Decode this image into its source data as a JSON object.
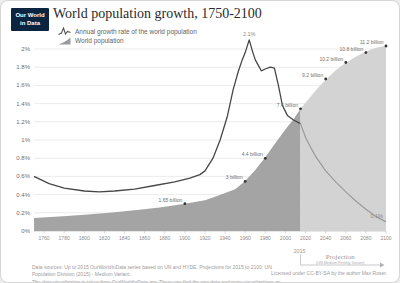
{
  "logo": {
    "line1": "Our World",
    "line2": "in Data"
  },
  "header": {
    "title": "World population growth, 1750-2100"
  },
  "legend": {
    "growth_label": "Annual growth rate of the world population",
    "population_label": "World population"
  },
  "footer": {
    "sources_line1": "Data sources: Up to 2015 OurWorldInData series based on UN and HYDE. Projections for 2015 to 2100: UN Population Division (2015) - Medium Variant.",
    "sources_line2": "The data visualization is taken from OurWorldInData.org. There you find the raw data and more visualizations on this topic.",
    "license": "Licensed under CC-BY-SA by the author Max Roser."
  },
  "chart_data": {
    "type": "area+line",
    "title": "World population growth, 1750-2100",
    "x_range": [
      1750,
      2100
    ],
    "x_ticks": [
      1760,
      1780,
      1800,
      1820,
      1840,
      1860,
      1880,
      1900,
      1920,
      1940,
      1960,
      1980,
      2000,
      2020,
      2040,
      2060,
      2080,
      2100
    ],
    "y_left": {
      "unit": "%",
      "range": [
        0,
        2.2
      ],
      "ticks": [
        {
          "label": "0%",
          "value": 0
        },
        {
          "label": "0.2%",
          "value": 0.2
        },
        {
          "label": "0.4%",
          "value": 0.4
        },
        {
          "label": "0.6%",
          "value": 0.6
        },
        {
          "label": "0.8%",
          "value": 0.8
        },
        {
          "label": "1%",
          "value": 1.0
        },
        {
          "label": "1.2%",
          "value": 1.2
        },
        {
          "label": "1.4%",
          "value": 1.4
        },
        {
          "label": "1.6%",
          "value": 1.6
        },
        {
          "label": "1.8%",
          "value": 1.8
        },
        {
          "label": "2%",
          "value": 2.0
        }
      ]
    },
    "projection": {
      "start_year": 2015,
      "marker_label": "2015",
      "label": "Projection",
      "sublabel": "(UN Medium Fertility Variant)"
    },
    "series": [
      {
        "name": "Annual growth rate of the world population",
        "type": "line",
        "unit": "percent",
        "points": [
          [
            1750,
            0.6
          ],
          [
            1765,
            0.52
          ],
          [
            1780,
            0.47
          ],
          [
            1800,
            0.44
          ],
          [
            1815,
            0.43
          ],
          [
            1830,
            0.44
          ],
          [
            1850,
            0.46
          ],
          [
            1870,
            0.5
          ],
          [
            1890,
            0.54
          ],
          [
            1905,
            0.58
          ],
          [
            1915,
            0.62
          ],
          [
            1920,
            0.66
          ],
          [
            1928,
            0.8
          ],
          [
            1935,
            1.0
          ],
          [
            1942,
            1.25
          ],
          [
            1948,
            1.55
          ],
          [
            1953,
            1.75
          ],
          [
            1957,
            1.88
          ],
          [
            1960,
            1.96
          ],
          [
            1964,
            2.1
          ],
          [
            1968,
            1.95
          ],
          [
            1970,
            1.88
          ],
          [
            1973,
            1.82
          ],
          [
            1976,
            1.76
          ],
          [
            1980,
            1.78
          ],
          [
            1985,
            1.8
          ],
          [
            1989,
            1.79
          ],
          [
            1993,
            1.6
          ],
          [
            1997,
            1.38
          ],
          [
            2002,
            1.27
          ],
          [
            2008,
            1.22
          ],
          [
            2015,
            1.18
          ],
          [
            2020,
            1.03
          ],
          [
            2025,
            0.92
          ],
          [
            2030,
            0.82
          ],
          [
            2040,
            0.66
          ],
          [
            2050,
            0.54
          ],
          [
            2060,
            0.43
          ],
          [
            2070,
            0.33
          ],
          [
            2080,
            0.24
          ],
          [
            2090,
            0.16
          ],
          [
            2100,
            0.1
          ]
        ]
      },
      {
        "name": "World population",
        "type": "area",
        "unit": "billion",
        "points": [
          [
            1750,
            0.79
          ],
          [
            1775,
            0.87
          ],
          [
            1800,
            0.98
          ],
          [
            1825,
            1.1
          ],
          [
            1850,
            1.26
          ],
          [
            1875,
            1.42
          ],
          [
            1900,
            1.65
          ],
          [
            1910,
            1.75
          ],
          [
            1920,
            1.86
          ],
          [
            1930,
            2.07
          ],
          [
            1940,
            2.3
          ],
          [
            1950,
            2.53
          ],
          [
            1960,
            3.03
          ],
          [
            1970,
            3.7
          ],
          [
            1980,
            4.46
          ],
          [
            1990,
            5.33
          ],
          [
            2000,
            6.14
          ],
          [
            2008,
            6.77
          ],
          [
            2015,
            7.4
          ],
          [
            2020,
            7.76
          ],
          [
            2030,
            8.5
          ],
          [
            2040,
            9.16
          ],
          [
            2050,
            9.73
          ],
          [
            2060,
            10.18
          ],
          [
            2070,
            10.55
          ],
          [
            2080,
            10.87
          ],
          [
            2090,
            11.09
          ],
          [
            2100,
            11.21
          ]
        ]
      }
    ],
    "point_labels": [
      {
        "year": 1900,
        "value": 1.65,
        "label": "1.65 billion"
      },
      {
        "year": 1960,
        "value": 3.0,
        "label": "3 billion"
      },
      {
        "year": 1980,
        "value": 4.4,
        "label": "4.4 billion"
      },
      {
        "year": 2015,
        "value": 7.4,
        "label": "7.4 billion"
      },
      {
        "year": 2040,
        "value": 9.2,
        "label": "9.2 billion"
      },
      {
        "year": 2060,
        "value": 10.2,
        "label": "10.2 billion"
      },
      {
        "year": 2080,
        "value": 10.8,
        "label": "10.8 billion"
      },
      {
        "year": 2100,
        "value": 11.2,
        "label": "11.2 billion"
      }
    ],
    "line_labels": [
      {
        "year": 1964,
        "value": 2.1,
        "label": "2.1%"
      },
      {
        "year": 2100,
        "value": 0.1,
        "label": "0.1%"
      }
    ],
    "colors": {
      "area_history": "#a4a4a4",
      "area_projection": "#d3d3d3",
      "line_history": "#474747",
      "line_projection": "#9a9a9a",
      "grid": "#e4e4e4",
      "axis_text": "#8c8c8c"
    }
  }
}
